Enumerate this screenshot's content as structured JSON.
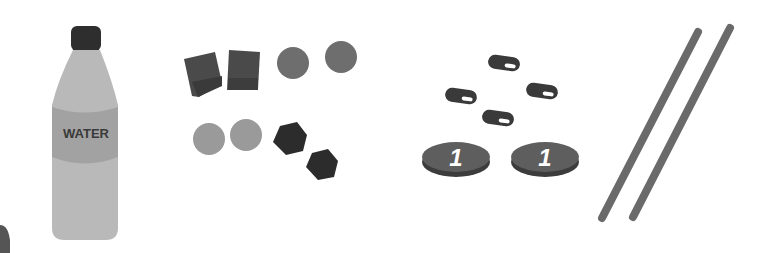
{
  "scene": {
    "description": "Grayscale clip-art of counting objects: water bottle, blocks, counters, buttons, coins, sticks",
    "bottle": {
      "label": "WATER"
    },
    "coins": [
      {
        "value": "1"
      },
      {
        "value": "1"
      }
    ],
    "colors": {
      "background": "#ffffff",
      "bottle_body": "#b9b9b9",
      "bottle_label": "#a2a2a2",
      "bottle_cap": "#2e2e2e",
      "dark_block": "#4a4a4a",
      "mid_disc": "#6e6e6e",
      "light_disc": "#9a9a9a",
      "hexagon": "#2c2c2c",
      "button": "#3a3a3a",
      "coin_face": "#5e5e5e",
      "coin_edge": "#3c3c3c",
      "stick": "#6a6a6a"
    }
  }
}
